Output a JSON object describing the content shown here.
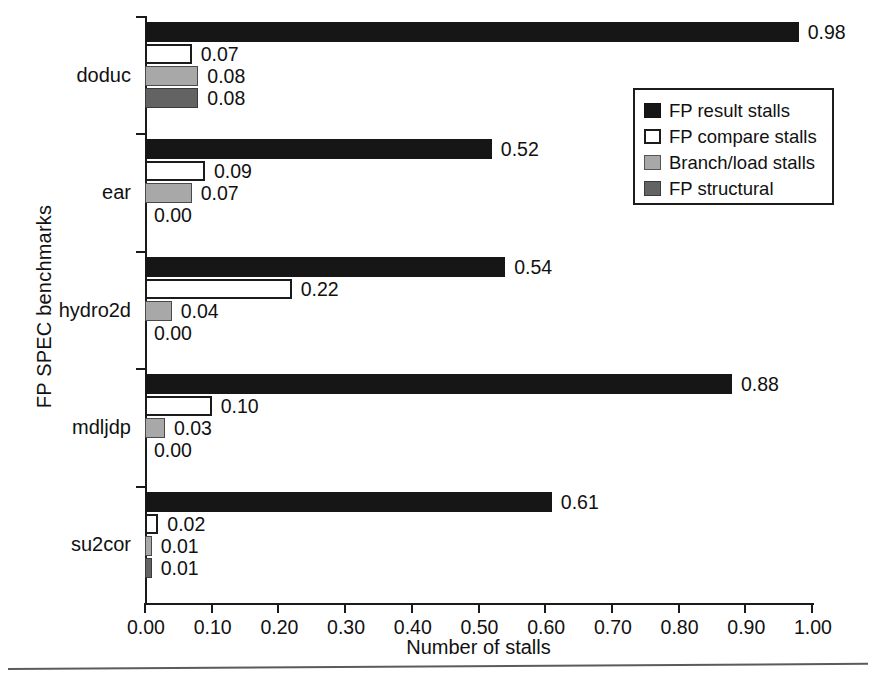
{
  "chart_data": {
    "type": "bar",
    "orientation": "horizontal",
    "title": "",
    "xlabel": "Number of stalls",
    "ylabel": "FP SPEC benchmarks",
    "xlim": [
      0.0,
      1.0
    ],
    "xticks": [
      "0.00",
      "0.10",
      "0.20",
      "0.30",
      "0.40",
      "0.50",
      "0.60",
      "0.70",
      "0.80",
      "0.90",
      "1.00"
    ],
    "grid": false,
    "legend_position": "upper right",
    "categories": [
      "doduc",
      "ear",
      "hydro2d",
      "mdljdp",
      "su2cor"
    ],
    "series": [
      {
        "name": "FP result stalls",
        "color": "#161616",
        "values": [
          0.98,
          0.52,
          0.54,
          0.88,
          0.61
        ],
        "labels": [
          "0.98",
          "0.52",
          "0.54",
          "0.88",
          "0.61"
        ]
      },
      {
        "name": "FP compare stalls",
        "color": "#ffffff",
        "values": [
          0.07,
          0.09,
          0.22,
          0.1,
          0.02
        ],
        "labels": [
          "0.07",
          "0.09",
          "0.22",
          "0.10",
          "0.02"
        ]
      },
      {
        "name": "Branch/load stalls",
        "color": "#a8a8a8",
        "values": [
          0.08,
          0.07,
          0.04,
          0.03,
          0.01
        ],
        "labels": [
          "0.08",
          "0.07",
          "0.04",
          "0.03",
          "0.01"
        ]
      },
      {
        "name": "FP structural",
        "color": "#636363",
        "values": [
          0.08,
          0.0,
          0.0,
          0.0,
          0.01
        ],
        "labels": [
          "0.08",
          "0.00",
          "0.00",
          "0.00",
          "0.01"
        ]
      }
    ]
  },
  "legend": {
    "items": [
      {
        "label": "FP result stalls"
      },
      {
        "label": "FP compare stalls"
      },
      {
        "label": "Branch/load stalls"
      },
      {
        "label": "FP structural"
      }
    ]
  }
}
